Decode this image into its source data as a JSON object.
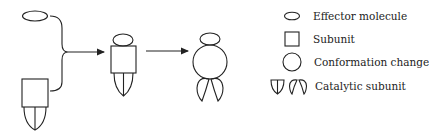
{
  "diagram": {
    "type": "allosteric-activation-schematic",
    "stroke_color": "#222222",
    "steps": [
      {
        "id": "separate",
        "components": [
          "effector-molecule",
          "subunit-with-catalytic-subunit"
        ]
      },
      {
        "id": "bound",
        "components": [
          "effector-molecule",
          "subunit",
          "catalytic-subunit"
        ]
      },
      {
        "id": "conformation-changed",
        "components": [
          "effector-molecule",
          "conformation-change",
          "catalytic-subunit-open"
        ]
      }
    ],
    "arrows": [
      {
        "from": "separate",
        "to": "bound",
        "style": "bracket-merge"
      },
      {
        "from": "bound",
        "to": "conformation-changed",
        "style": "straight"
      }
    ]
  },
  "legend": {
    "items": [
      {
        "icon": "ellipse-icon",
        "label": "Effector molecule"
      },
      {
        "icon": "square-icon",
        "label": "Subunit"
      },
      {
        "icon": "circle-icon",
        "label": "Conformation change"
      },
      {
        "icon": "catalytic-subunit-icon",
        "label": "Catalytic subunit"
      }
    ]
  }
}
